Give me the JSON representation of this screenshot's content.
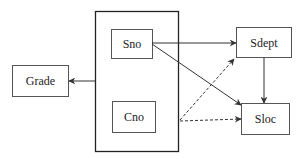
{
  "diagram": {
    "type": "functional-dependency-graph",
    "colors": {
      "stroke": "#333333",
      "box_stroke": "#555555",
      "text": "#222222",
      "background": "#ffffff"
    },
    "group": {
      "id": "key",
      "members": [
        "Sno",
        "Cno"
      ]
    },
    "nodes": [
      {
        "id": "sno",
        "label": "Sno"
      },
      {
        "id": "cno",
        "label": "Cno"
      },
      {
        "id": "grade",
        "label": "Grade"
      },
      {
        "id": "sdept",
        "label": "Sdept"
      },
      {
        "id": "sloc",
        "label": "Sloc"
      }
    ],
    "edges": [
      {
        "from": "Sno,Cno",
        "to": "Grade",
        "style": "solid"
      },
      {
        "from": "Sno",
        "to": "Sdept",
        "style": "solid"
      },
      {
        "from": "Sno",
        "to": "Sloc",
        "style": "solid"
      },
      {
        "from": "Sdept",
        "to": "Sloc",
        "style": "solid"
      },
      {
        "from": "Sno,Cno",
        "to": "Sdept",
        "style": "dashed"
      },
      {
        "from": "Sno,Cno",
        "to": "Sloc",
        "style": "dashed"
      }
    ]
  }
}
